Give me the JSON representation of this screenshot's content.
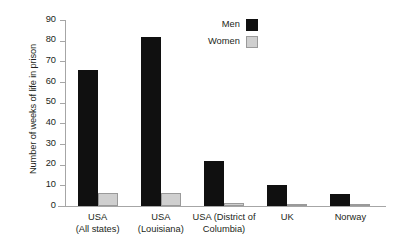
{
  "chart_data": {
    "type": "bar",
    "title": "",
    "xlabel": "",
    "ylabel": "Number of weeks of life in prison",
    "ylim": [
      0,
      90
    ],
    "yticks": [
      0,
      10,
      20,
      30,
      40,
      50,
      60,
      70,
      80,
      90
    ],
    "grid": false,
    "legend_position": "top-right",
    "categories": [
      "USA\n(All states)",
      "USA\n(Louisiana)",
      "USA (District of\nColumbia)",
      "UK",
      "Norway"
    ],
    "category_lines": [
      [
        "USA",
        "(All states)"
      ],
      [
        "USA",
        "(Louisiana)"
      ],
      [
        "USA (District of",
        "Columbia)"
      ],
      [
        "UK",
        ""
      ],
      [
        "Norway",
        ""
      ]
    ],
    "series": [
      {
        "name": "Men",
        "color": "#101010",
        "values": [
          66,
          82,
          22,
          10.2,
          5.8
        ]
      },
      {
        "name": "Women",
        "color": "#cfcfcf",
        "values": [
          6.3,
          6.2,
          1.3,
          0.5,
          0.3
        ]
      }
    ]
  },
  "axis": {
    "y_tick_labels": [
      "0",
      "10",
      "20",
      "30",
      "40",
      "50",
      "60",
      "70",
      "80",
      "90"
    ],
    "y_title": "Number of weeks of life in prison"
  },
  "legend": {
    "entries": [
      {
        "label": "Men",
        "swatch": "black-square-swatch"
      },
      {
        "label": "Women",
        "swatch": "gray-square-swatch"
      }
    ]
  },
  "colors": {
    "men": "#101010",
    "women": "#cfcfcf",
    "women_border": "#9a9a9a",
    "axis": "#a6a6a6",
    "text": "#231f20",
    "background": "#ffffff"
  }
}
